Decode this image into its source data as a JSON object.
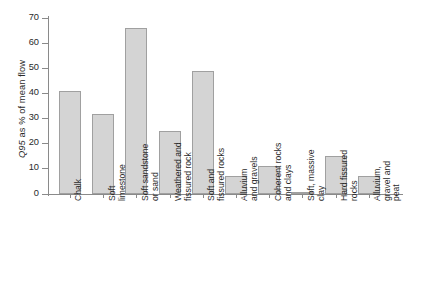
{
  "chart_data": {
    "type": "bar",
    "title": "",
    "subtitle": "",
    "xlabel": "",
    "ylabel": "Q95 as % of mean flow",
    "ylabel_italic_prefix": "Q95",
    "ylabel_rest": " as % of mean flow",
    "ylim": [
      0,
      70
    ],
    "yticks": [
      0,
      10,
      20,
      30,
      40,
      50,
      60,
      70
    ],
    "grid": false,
    "legend": null,
    "bar_fill_color": "#d4d4d4",
    "bar_border_color": "#a0a0a0",
    "axis_color": "#8a8a8a",
    "categories": [
      "Chalk",
      "Soft\nlimestone",
      "Soft sandstone\nor sand",
      "Weathered and\nfissured rock",
      "Soft and\nfissured rocks",
      "Alluvium\nand gravels",
      "Coherent rocks\nand clays",
      "Soft, massive\nclay",
      "Hard fissured\nrocks",
      "Alluvium,\ngravel and peat"
    ],
    "values": [
      41,
      32,
      66,
      25,
      49,
      7,
      11,
      1,
      15,
      7
    ]
  }
}
